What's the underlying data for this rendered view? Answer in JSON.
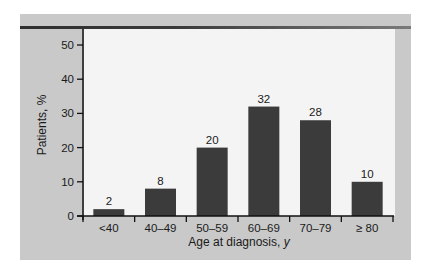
{
  "chart_data": {
    "type": "bar",
    "title": "",
    "xlabel": "Age at diagnosis, y",
    "ylabel": "Patients, %",
    "categories": [
      "<40",
      "40–49",
      "50–59",
      "60–69",
      "70–79",
      "≥ 80"
    ],
    "values": [
      2,
      8,
      20,
      32,
      28,
      10
    ],
    "data_labels": [
      "2",
      "8",
      "20",
      "32",
      "28",
      "10"
    ],
    "ylim": [
      0,
      50
    ],
    "yticks": [
      0,
      10,
      20,
      30,
      40,
      50
    ],
    "grid": false,
    "legend": null,
    "bar_color": "#3b3b3b"
  },
  "colors": {
    "panel": "#c9c9c9",
    "plot_bg": "#f4f4f4",
    "bar": "#3b3b3b",
    "axis": "#111111"
  }
}
